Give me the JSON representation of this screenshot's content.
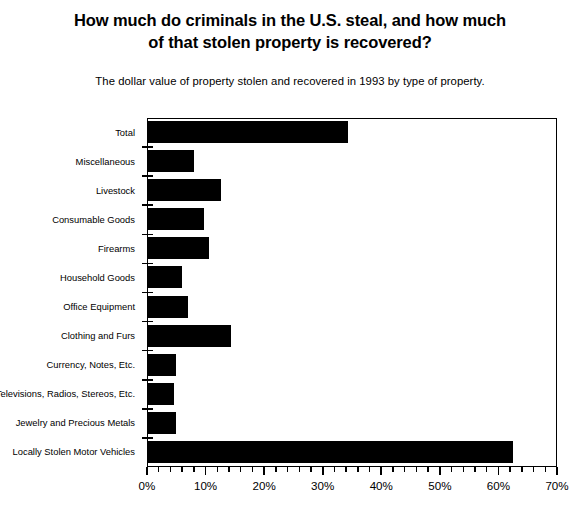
{
  "header": {
    "title": "How much do criminals in the U.S. steal, and how much of that stolen property is recovered?",
    "title_line1": "How much do criminals in the U.S. steal, and how much",
    "title_line2": "of that stolen property is recovered?",
    "subtitle": "The dollar value of property stolen and recovered in 1993 by type of property."
  },
  "chart_data": {
    "type": "bar",
    "orientation": "horizontal",
    "title": "How much do criminals in the U.S. steal, and how much of that stolen property is recovered?",
    "subtitle": "The dollar value of property stolen and recovered in 1993 by type of property.",
    "xlabel": "",
    "ylabel": "",
    "xlim": [
      0,
      70
    ],
    "ylim": null,
    "grid": false,
    "legend": null,
    "xtick_labels": [
      "0%",
      "10%",
      "20%",
      "30%",
      "40%",
      "50%",
      "60%",
      "70%"
    ],
    "xtick_values": [
      0,
      10,
      20,
      30,
      40,
      50,
      60,
      70
    ],
    "xtick_minor_step": 2,
    "bar_color": "#000000",
    "categories": [
      "Total",
      "Miscellaneous",
      "Livestock",
      "Consumable Goods",
      "Firearms",
      "Household Goods",
      "Office Equipment",
      "Clothing and Furs",
      "Currency, Notes, Etc.",
      "Televisions, Radios, Stereos, Etc.",
      "Jewelry and Precious Metals",
      "Locally Stolen Motor Vehicles"
    ],
    "values": [
      34.3,
      8.1,
      12.7,
      9.8,
      10.6,
      6.0,
      7.0,
      14.4,
      5.0,
      4.6,
      5.0,
      62.5
    ],
    "value_unit": "percent recovered"
  }
}
